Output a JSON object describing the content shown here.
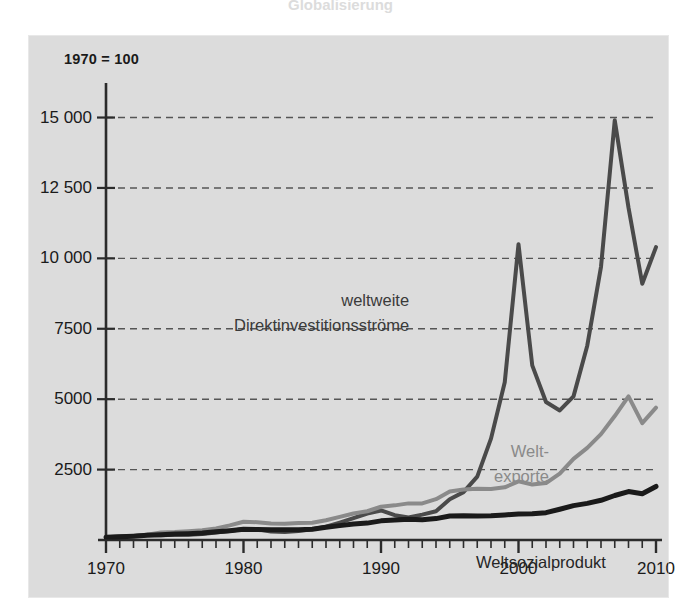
{
  "figure": {
    "title_remnant": "Globalisierung",
    "index_note": "1970 = 100",
    "background": "#dcdcdc",
    "page_background": "#ffffff"
  },
  "axes": {
    "y_ticks": [
      {
        "value": 15000,
        "label": "15 000"
      },
      {
        "value": 12500,
        "label": "12 500"
      },
      {
        "value": 10000,
        "label": "10 000"
      },
      {
        "value": 7500,
        "label": "7500"
      },
      {
        "value": 5000,
        "label": "5000"
      },
      {
        "value": 2500,
        "label": "2500"
      }
    ],
    "x_ticks": [
      {
        "value": 1970,
        "label": "1970"
      },
      {
        "value": 1980,
        "label": "1980"
      },
      {
        "value": 1990,
        "label": "1990"
      },
      {
        "value": 2000,
        "label": "2000"
      },
      {
        "value": 2010,
        "label": "2010"
      }
    ],
    "x_minor_step": 1,
    "grid": "horizontal-dashed"
  },
  "labels": {
    "fdi_line1": "weltweite",
    "fdi_line2": "Direktinvestitionsströme",
    "exports_line1": "Welt-",
    "exports_line2": "exporte",
    "gwp": "Weltsozialprodukt"
  },
  "colors": {
    "fdi": "#4a4a4a",
    "exports": "#8a8a8a",
    "gwp": "#1a1a1a",
    "axis": "#2b2b2b",
    "grid": "#555555",
    "panel": "#dcdcdc"
  },
  "chart_data": {
    "type": "line",
    "title": "Globalisierung",
    "subtitle": "1970 = 100",
    "xlabel": "",
    "ylabel": "Index (1970 = 100)",
    "xlim": [
      1970,
      2010
    ],
    "ylim": [
      0,
      15800
    ],
    "grid": true,
    "legend": "inline-annotations",
    "x": [
      1970,
      1971,
      1972,
      1973,
      1974,
      1975,
      1976,
      1977,
      1978,
      1979,
      1980,
      1981,
      1982,
      1983,
      1984,
      1985,
      1986,
      1987,
      1988,
      1989,
      1990,
      1991,
      1992,
      1993,
      1994,
      1995,
      1996,
      1997,
      1998,
      1999,
      2000,
      2001,
      2002,
      2003,
      2004,
      2005,
      2006,
      2007,
      2008,
      2009,
      2010
    ],
    "series": [
      {
        "name": "weltweite Direktinvestitionsströme",
        "color": "#4a4a4a",
        "width": 4,
        "values": [
          100,
          120,
          140,
          185,
          170,
          185,
          190,
          215,
          270,
          320,
          390,
          380,
          300,
          280,
          320,
          380,
          470,
          620,
          780,
          940,
          1050,
          880,
          800,
          900,
          1020,
          1450,
          1700,
          2250,
          3600,
          5600,
          10500,
          6200,
          4900,
          4600,
          5100,
          6900,
          9700,
          14900,
          11800,
          9100,
          10400
        ]
      },
      {
        "name": "Weltexporte",
        "color": "#8a8a8a",
        "width": 4,
        "values": [
          100,
          115,
          135,
          185,
          265,
          280,
          310,
          350,
          410,
          520,
          650,
          630,
          590,
          580,
          600,
          610,
          700,
          820,
          940,
          1020,
          1180,
          1230,
          1300,
          1300,
          1450,
          1720,
          1790,
          1820,
          1810,
          1870,
          2080,
          1970,
          2020,
          2360,
          2880,
          3270,
          3760,
          4400,
          5100,
          4150,
          4700
        ]
      },
      {
        "name": "Weltsozialprodukt",
        "color": "#1a1a1a",
        "width": 5,
        "values": [
          100,
          115,
          135,
          165,
          190,
          210,
          225,
          250,
          290,
          330,
          380,
          375,
          360,
          360,
          365,
          380,
          450,
          510,
          570,
          600,
          680,
          710,
          740,
          720,
          760,
          850,
          860,
          850,
          860,
          890,
          920,
          930,
          970,
          1090,
          1220,
          1300,
          1410,
          1580,
          1720,
          1640,
          1900
        ]
      }
    ],
    "annotations": [
      {
        "text": "weltweite Direktinvestitionsströme",
        "x": 1995,
        "y": 8400
      },
      {
        "text": "Welt-exporte",
        "x": 2003,
        "y": 3900
      },
      {
        "text": "Weltsozialprodukt",
        "x": 2005,
        "y": 1350
      }
    ]
  }
}
